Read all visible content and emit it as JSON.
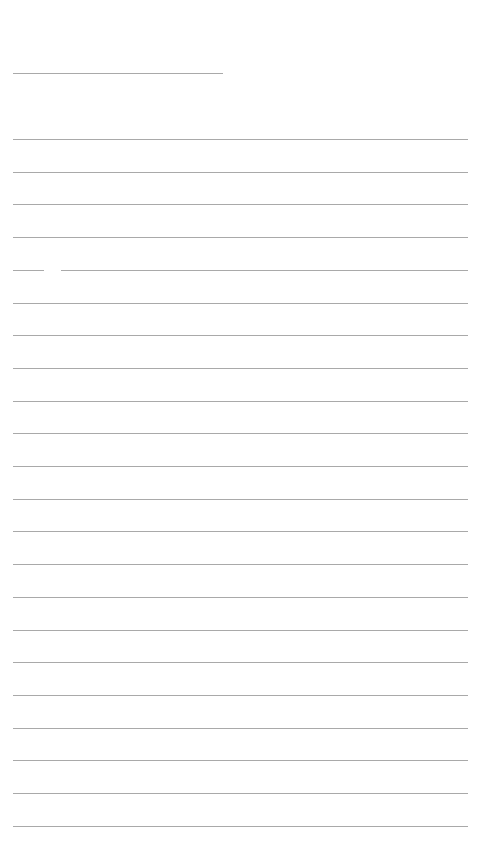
{
  "page": {
    "type": "lined-sheet",
    "background": "#ffffff",
    "line_color": "#9a9a9a",
    "header_line": {
      "x": 13,
      "y": 73,
      "width": 210
    },
    "ruled_lines": {
      "count": 22,
      "start_y": 139,
      "spacing": 32.7,
      "x": 13,
      "width": 455
    },
    "line_gap": {
      "line_index": 4,
      "x": 44,
      "width": 17
    }
  }
}
